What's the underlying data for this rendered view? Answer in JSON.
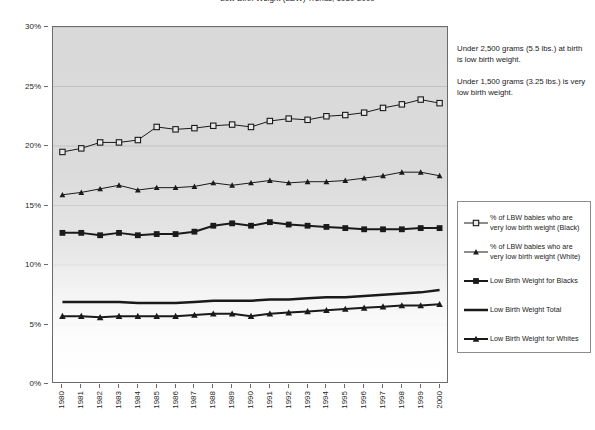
{
  "chart_data": {
    "type": "line",
    "title": "Low Birth Weight (LBW) Trends, 1980-2000",
    "xlabel": "",
    "ylabel": "",
    "ylim": [
      0,
      30
    ],
    "y_tick_labels": [
      "0%",
      "5%",
      "10%",
      "15%",
      "20%",
      "25%",
      "30%"
    ],
    "y_tick_values": [
      0,
      5,
      10,
      15,
      20,
      25,
      30
    ],
    "grid": true,
    "legend_position": "right",
    "plot_background": "#d9d9d9",
    "series_color": "#1a1a1a",
    "x": [
      1980,
      1981,
      1982,
      1983,
      1984,
      1985,
      1986,
      1987,
      1988,
      1989,
      1990,
      1991,
      1992,
      1993,
      1994,
      1995,
      1996,
      1997,
      1998,
      1999,
      2000
    ],
    "categories": [
      "1980",
      "1981",
      "1982",
      "1983",
      "1984",
      "1985",
      "1986",
      "1987",
      "1988",
      "1989",
      "1990",
      "1991",
      "1992",
      "1993",
      "1994",
      "1995",
      "1996",
      "1997",
      "1998",
      "1999",
      "2000"
    ],
    "series": [
      {
        "name": "% of LBW babies who are very low birth weight (Black)",
        "marker": "square-open",
        "line_width": 1,
        "values": [
          19.5,
          19.8,
          20.3,
          20.3,
          20.5,
          21.6,
          21.4,
          21.5,
          21.7,
          21.8,
          21.6,
          22.1,
          22.3,
          22.2,
          22.5,
          22.6,
          22.8,
          23.2,
          23.5,
          23.9,
          23.6
        ]
      },
      {
        "name": "% of LBW babies who are very low birth weight (White)",
        "marker": "triangle-small",
        "line_width": 1,
        "values": [
          15.9,
          16.1,
          16.4,
          16.7,
          16.3,
          16.5,
          16.5,
          16.6,
          16.9,
          16.7,
          16.9,
          17.1,
          16.9,
          17.0,
          17.0,
          17.1,
          17.3,
          17.5,
          17.8,
          17.8,
          17.5
        ]
      },
      {
        "name": "Low Birth Weight for Blacks",
        "marker": "square-filled",
        "line_width": 2,
        "values": [
          12.7,
          12.7,
          12.5,
          12.7,
          12.5,
          12.6,
          12.6,
          12.8,
          13.3,
          13.5,
          13.3,
          13.6,
          13.4,
          13.3,
          13.2,
          13.1,
          13.0,
          13.0,
          13.0,
          13.1,
          13.1
        ]
      },
      {
        "name": "Low Birth Weight Total",
        "marker": "none",
        "line_width": 2.5,
        "values": [
          6.9,
          6.9,
          6.9,
          6.9,
          6.8,
          6.8,
          6.8,
          6.9,
          7.0,
          7.0,
          7.0,
          7.1,
          7.1,
          7.2,
          7.3,
          7.3,
          7.4,
          7.5,
          7.6,
          7.7,
          7.9
        ]
      },
      {
        "name": "Low Birth Weight for Whites",
        "marker": "triangle-filled",
        "line_width": 2,
        "values": [
          5.7,
          5.7,
          5.6,
          5.7,
          5.7,
          5.7,
          5.7,
          5.8,
          5.9,
          5.9,
          5.7,
          5.9,
          6.0,
          6.1,
          6.2,
          6.3,
          6.4,
          6.5,
          6.6,
          6.6,
          6.7
        ]
      }
    ],
    "annotations": [
      "Under 2,500 grams (5.5 lbs.) at birth is low birth weight.",
      "Under 1,500 grams (3.25 lbs.) is very low birth weight."
    ]
  },
  "legend": {
    "items": [
      {
        "label": "% of LBW babies who are very low birth weight (Black)",
        "glyph": "square-open-line-icon"
      },
      {
        "label": "% of LBW babies who are very low birth weight (White)",
        "glyph": "triangle-small-line-icon"
      },
      {
        "label": "Low Birth Weight for Blacks",
        "glyph": "square-filled-line-icon"
      },
      {
        "label": "Low Birth Weight Total",
        "glyph": "plain-line-icon"
      },
      {
        "label": "Low Birth Weight for Whites",
        "glyph": "triangle-filled-line-icon"
      }
    ]
  },
  "annotations": {
    "note_1": "Under 2,500 grams (5.5 lbs.) at birth is low birth weight.",
    "note_2": "Under 1,500 grams (3.25 lbs.) is very low birth weight."
  }
}
